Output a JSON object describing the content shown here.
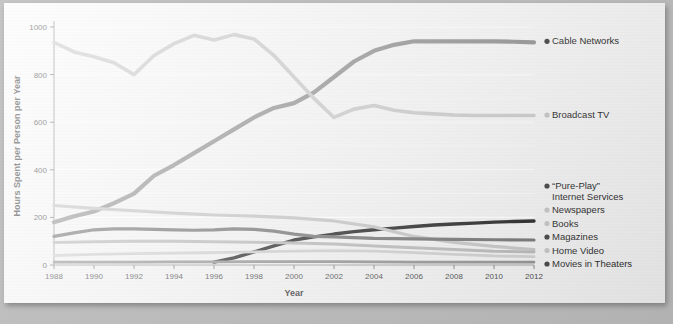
{
  "chart_data": {
    "type": "line",
    "title": "",
    "xlabel": "Year",
    "ylabel": "Hours Spent per Person per Year",
    "xlim": [
      1988,
      2012
    ],
    "ylim": [
      0,
      1000
    ],
    "ytick_step": 200,
    "yminor_step": 100,
    "xtick_step": 2,
    "grid": true,
    "legend_position": "right",
    "xticks": [
      "1988",
      "1990",
      "1992",
      "1994",
      "1996",
      "1998",
      "2000",
      "2002",
      "2004",
      "2006",
      "2008",
      "2010",
      "2012"
    ],
    "yticks": [
      "0",
      "200",
      "400",
      "600",
      "800",
      "1000"
    ],
    "series": [
      {
        "name": "Cable Networks",
        "color": "#8f8f8f",
        "width": 4.2,
        "legend_label": "Cable Networks",
        "legend_anchor": 940,
        "x": [
          1988,
          1989,
          1990,
          1991,
          1992,
          1993,
          1994,
          1995,
          1996,
          1997,
          1998,
          1999,
          2000,
          2001,
          2002,
          2003,
          2004,
          2005,
          2006,
          2007,
          2008,
          2009,
          2010,
          2011,
          2012
        ],
        "y": [
          180,
          205,
          225,
          260,
          300,
          375,
          420,
          470,
          520,
          570,
          620,
          660,
          680,
          725,
          790,
          855,
          900,
          925,
          940,
          940,
          940,
          940,
          940,
          938,
          935
        ]
      },
      {
        "name": "Broadcast TV",
        "color": "#c9c9c9",
        "width": 3.6,
        "legend_label": "Broadcast TV",
        "legend_anchor": 630,
        "x": [
          1988,
          1989,
          1990,
          1991,
          1992,
          1993,
          1994,
          1995,
          1996,
          1997,
          1998,
          1999,
          2000,
          2001,
          2002,
          2003,
          2004,
          2005,
          2006,
          2007,
          2008,
          2009,
          2010,
          2011,
          2012
        ],
        "y": [
          935,
          895,
          875,
          850,
          800,
          880,
          930,
          965,
          945,
          968,
          950,
          880,
          790,
          700,
          620,
          655,
          670,
          650,
          640,
          635,
          630,
          628,
          628,
          628,
          628
        ]
      },
      {
        "name": "“Pure-Play” Internet Services",
        "color": "#1c1c1c",
        "width": 3.4,
        "legend_label": "“Pure-Play”",
        "legend_label2": "Internet Services",
        "legend_anchor": 185,
        "x": [
          1996,
          1997,
          1998,
          1999,
          2000,
          2001,
          2002,
          2003,
          2004,
          2005,
          2006,
          2007,
          2008,
          2009,
          2010,
          2011,
          2012
        ],
        "y": [
          12,
          30,
          55,
          80,
          105,
          118,
          130,
          140,
          148,
          155,
          162,
          168,
          172,
          176,
          180,
          183,
          185
        ]
      },
      {
        "name": "Newspapers",
        "color": "#c2c2c2",
        "width": 3.2,
        "legend_label": "Newspapers",
        "legend_anchor": 148,
        "x": [
          1988,
          1990,
          1992,
          1994,
          1996,
          1998,
          2000,
          2002,
          2004,
          2006,
          2008,
          2010,
          2012
        ],
        "y": [
          250,
          238,
          228,
          218,
          210,
          205,
          198,
          185,
          160,
          120,
          95,
          78,
          65
        ]
      },
      {
        "name": "Books",
        "color": "#b5b5b5",
        "width": 3.0,
        "legend_label": "Books",
        "legend_anchor": 118,
        "x": [
          1988,
          1990,
          1992,
          1994,
          1996,
          1998,
          2000,
          2002,
          2004,
          2006,
          2008,
          2010,
          2012
        ],
        "y": [
          95,
          98,
          100,
          100,
          98,
          96,
          92,
          88,
          80,
          72,
          65,
          58,
          55
        ]
      },
      {
        "name": "Magazines",
        "color": "#6d6d6d",
        "width": 3.2,
        "legend_label": "Magazines",
        "legend_anchor": 88,
        "x": [
          1988,
          1989,
          1990,
          1991,
          1992,
          1993,
          1994,
          1995,
          1996,
          1997,
          1998,
          1999,
          2000,
          2001,
          2002,
          2003,
          2004,
          2006,
          2008,
          2010,
          2012
        ],
        "y": [
          120,
          135,
          148,
          152,
          152,
          150,
          148,
          146,
          148,
          152,
          150,
          142,
          130,
          120,
          118,
          115,
          112,
          110,
          108,
          106,
          105
        ]
      },
      {
        "name": "Home Video",
        "color": "#cccccc",
        "width": 2.8,
        "legend_label": "Home Video",
        "legend_anchor": 58,
        "x": [
          1988,
          1990,
          1992,
          1994,
          1996,
          1998,
          2000,
          2002,
          2004,
          2006,
          2008,
          2010,
          2012
        ],
        "y": [
          40,
          45,
          48,
          50,
          52,
          55,
          58,
          60,
          58,
          52,
          45,
          38,
          35
        ]
      },
      {
        "name": "Movies in Theaters",
        "color": "#8a8a8a",
        "width": 2.6,
        "legend_label": "Movies in Theaters",
        "legend_anchor": 28,
        "x": [
          1988,
          1990,
          1992,
          1994,
          1996,
          1998,
          2000,
          2002,
          2004,
          2006,
          2008,
          2010,
          2012
        ],
        "y": [
          12,
          12,
          12,
          13,
          13,
          14,
          14,
          14,
          13,
          12,
          12,
          12,
          12
        ]
      }
    ]
  },
  "legend": {
    "items": [
      {
        "label": "Cable Networks",
        "marker": "dark"
      },
      {
        "label": "Broadcast TV",
        "marker": "light"
      },
      {
        "label": "“Pure-Play”",
        "label2": "Internet Services",
        "marker": "dark"
      },
      {
        "label": "Newspapers",
        "marker": "light"
      },
      {
        "label": "Books",
        "marker": "light"
      },
      {
        "label": "Magazines",
        "marker": "dark"
      },
      {
        "label": "Home Video",
        "marker": "light"
      },
      {
        "label": "Movies in Theaters",
        "marker": "dark"
      }
    ]
  },
  "colors": {
    "panel_bg": "#f7f7f7",
    "outer_bg": "#bdbdbd",
    "gridline": "#ffffff",
    "axis": "#8f8f8f",
    "text": "#1e1e1e"
  }
}
